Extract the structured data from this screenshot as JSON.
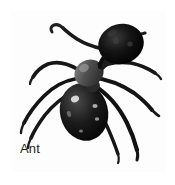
{
  "page": {
    "background_color": "#ffffff",
    "width": 175,
    "height": 185
  },
  "photo_card": {
    "border_color": "#2f3133",
    "inner_background": "#fdfdfd",
    "caption": "Ant",
    "caption_color": "#1d1f21"
  },
  "subject": {
    "name": "ant",
    "common_name": "Ant",
    "image_type": "black-and-white photograph",
    "view": "top-down dorsal view",
    "orientation": "head toward upper-right, abdomen toward lower-left",
    "body_color": "#141414",
    "thorax_color": "#5a5a5a",
    "highlight_color": "#e8e8e8",
    "parts": [
      "head",
      "compound-eye",
      "antenna-left",
      "antenna-right",
      "thorax",
      "petiole",
      "abdomen",
      "leg-front-left",
      "leg-middle-left",
      "leg-hind-left",
      "leg-front-right",
      "leg-middle-right",
      "leg-hind-right"
    ]
  }
}
